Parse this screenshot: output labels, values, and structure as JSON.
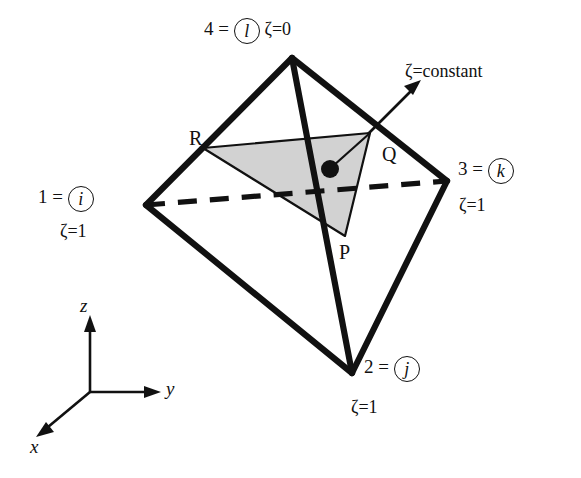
{
  "figure": {
    "type": "tetrahedron-isoparametric-diagram",
    "background_color": "#ffffff",
    "line_color": "#111111",
    "shaded_face_color": "#d2d2d2"
  },
  "vertices": {
    "top": {
      "number": "4 =",
      "circled_symbol": "l",
      "zeta": "ζ=0"
    },
    "left": {
      "number": "1 =",
      "circled_symbol": "i",
      "zeta": "ζ=1"
    },
    "right": {
      "number": "3 =",
      "circled_symbol": "k",
      "zeta": "ζ=1"
    },
    "bottom": {
      "number": "2 =",
      "circled_symbol": "j",
      "zeta": "ζ=1"
    }
  },
  "section_plane": {
    "annotation": "ζ=constant",
    "corner_labels": {
      "r": "R",
      "q": "Q",
      "p": "P"
    }
  },
  "axes": {
    "z": "z",
    "y": "y",
    "x": "x"
  }
}
